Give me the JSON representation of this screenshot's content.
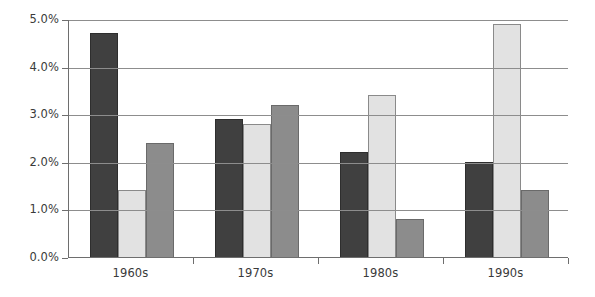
{
  "chart_data": {
    "type": "bar",
    "title": "",
    "subtitle": "",
    "xlabel": "",
    "ylabel": "",
    "categories": [
      "1960s",
      "1970s",
      "1980s",
      "1990s"
    ],
    "series": [
      {
        "name": "Series 1",
        "color": "#404040",
        "values": [
          4.7,
          2.9,
          2.2,
          2.0
        ]
      },
      {
        "name": "Series 2",
        "color": "#e2e2e2",
        "values": [
          1.4,
          2.8,
          3.4,
          4.9
        ]
      },
      {
        "name": "Series 3",
        "color": "#8c8c8c",
        "values": [
          2.4,
          3.2,
          0.8,
          1.4
        ]
      }
    ],
    "ylim": [
      0,
      5
    ],
    "ytick_values": [
      0.0,
      1.0,
      2.0,
      3.0,
      4.0,
      5.0
    ],
    "ytick_labels": [
      "0.0%",
      "1.0%",
      "2.0%",
      "3.0%",
      "4.0%",
      "5.0%"
    ],
    "value_suffix": "%",
    "grid": true,
    "grid_axis": "y",
    "legend": false,
    "legend_position": "none",
    "bar_mode": "grouped",
    "axis_color": "#6e6e6e",
    "gridline_color": "#8d8d8d",
    "background_color": "#ffffff",
    "text_color": "#3a3a3a"
  }
}
